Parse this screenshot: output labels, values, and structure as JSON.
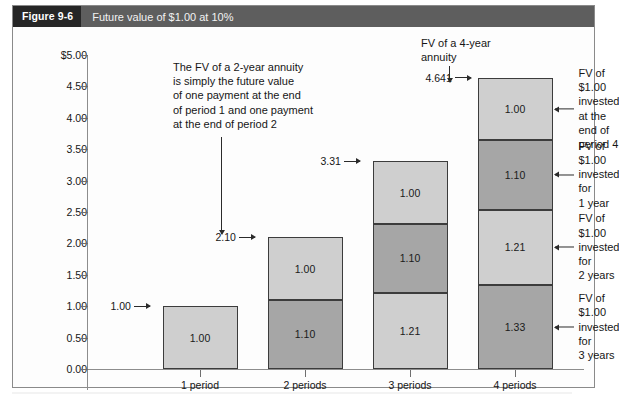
{
  "figure": {
    "tag": "Figure 9-6",
    "title": "Future value of $1.00 at 10%"
  },
  "chart_data": {
    "type": "bar",
    "title": "Future value of $1.00 at 10%",
    "xlabel": "",
    "ylabel": "",
    "ylim": [
      0,
      5
    ],
    "grid": false,
    "stacked": true,
    "legend": "none",
    "categories": [
      "1 period",
      "2 periods",
      "3 periods",
      "4 periods"
    ],
    "ytick_labels": [
      "$5.00",
      "4.50",
      "4.00",
      "3.50",
      "3.00",
      "2.50",
      "2.00",
      "1.50",
      "1.00",
      "0.50",
      "0.00"
    ],
    "ytick_values": [
      5.0,
      4.5,
      4.0,
      3.5,
      3.0,
      2.5,
      2.0,
      1.5,
      1.0,
      0.5,
      0.0
    ],
    "bars": [
      {
        "category": "1 period",
        "total": 1.0,
        "total_label": "1.00",
        "segments": [
          {
            "label": "1.00",
            "value": 1.0,
            "shade": "light"
          }
        ]
      },
      {
        "category": "2 periods",
        "total": 2.1,
        "total_label": "2.10",
        "segments": [
          {
            "label": "1.10",
            "value": 1.1,
            "shade": "dark"
          },
          {
            "label": "1.00",
            "value": 1.0,
            "shade": "light"
          }
        ]
      },
      {
        "category": "3 periods",
        "total": 3.31,
        "total_label": "3.31",
        "segments": [
          {
            "label": "1.21",
            "value": 1.21,
            "shade": "light"
          },
          {
            "label": "1.10",
            "value": 1.1,
            "shade": "dark"
          },
          {
            "label": "1.00",
            "value": 1.0,
            "shade": "light"
          }
        ]
      },
      {
        "category": "4 periods",
        "total": 4.641,
        "total_label": "4.641",
        "segments": [
          {
            "label": "1.33",
            "value": 1.33,
            "shade": "dark"
          },
          {
            "label": "1.21",
            "value": 1.21,
            "shade": "light"
          },
          {
            "label": "1.10",
            "value": 1.1,
            "shade": "dark"
          },
          {
            "label": "1.00",
            "value": 1.0,
            "shade": "light"
          }
        ]
      }
    ],
    "annotations": {
      "note_two_year": "The FV of a 2-year annuity\nis simply the future value\nof one payment at the end\nof period 1 and one payment\nat the end of period 2",
      "note_four_year": "FV of a 4-year\nannuity",
      "right_labels": [
        "FV of $1.00\ninvested at the\nend of period 4",
        "FV of $1.00\ninvested for\n1 year",
        "FV of $1.00\ninvested for\n2 years",
        "FV of $1.00\ninvested for\n3 years"
      ]
    }
  }
}
